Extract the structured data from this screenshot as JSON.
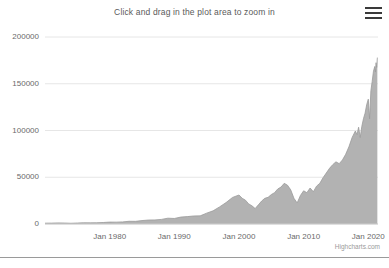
{
  "chart": {
    "title": "Click and drag in the plot area to zoom in",
    "credits": "Highcharts.com",
    "menu_icon": "hamburger-menu-icon",
    "accent_color": "#b2b2b2",
    "line_color": "#9a9a9a",
    "grid_color": "#e6e6e6",
    "text_color": "#6a6a6a"
  },
  "chart_data": {
    "type": "area",
    "title": "Click and drag in the plot area to zoom in",
    "subtitle": "",
    "xlabel": "",
    "ylabel": "",
    "grid": true,
    "legend": false,
    "xlim": [
      1970,
      2021.5
    ],
    "ylim": [
      0,
      200000
    ],
    "ytick_labels": [
      "0",
      "50000",
      "100000",
      "150000",
      "200000"
    ],
    "ytick_values": [
      0,
      50000,
      100000,
      150000,
      200000
    ],
    "xtick_labels": [
      "Jan 1980",
      "Jan 1990",
      "Jan 2000",
      "Jan 2010",
      "Jan 2020"
    ],
    "xtick_values": [
      1980,
      1990,
      2000,
      2010,
      2020
    ],
    "series": [
      {
        "name": "Index value",
        "x": [
          1970.0,
          1971.0,
          1972.0,
          1973.0,
          1974.0,
          1975.0,
          1976.0,
          1977.0,
          1978.0,
          1979.0,
          1980.0,
          1981.0,
          1982.0,
          1983.0,
          1984.0,
          1985.0,
          1986.0,
          1987.0,
          1988.0,
          1989.0,
          1990.0,
          1991.0,
          1992.0,
          1993.0,
          1994.0,
          1995.0,
          1996.0,
          1997.0,
          1998.0,
          1999.0,
          2000.0,
          2000.5,
          2001.0,
          2001.5,
          2002.0,
          2002.5,
          2003.0,
          2003.5,
          2004.0,
          2004.5,
          2005.0,
          2005.5,
          2006.0,
          2006.5,
          2007.0,
          2007.5,
          2008.0,
          2008.5,
          2009.0,
          2009.5,
          2010.0,
          2010.5,
          2011.0,
          2011.5,
          2012.0,
          2012.5,
          2013.0,
          2013.5,
          2014.0,
          2014.5,
          2015.0,
          2015.5,
          2016.0,
          2016.5,
          2017.0,
          2017.5,
          2018.0,
          2018.25,
          2018.5,
          2018.75,
          2019.0,
          2019.25,
          2019.5,
          2019.75,
          2020.0,
          2020.2,
          2020.4,
          2020.6,
          2020.8,
          2021.0,
          2021.1,
          2021.2,
          2021.3,
          2021.4
        ],
        "y": [
          900,
          950,
          1150,
          1050,
          800,
          1050,
          1300,
          1250,
          1350,
          1600,
          2050,
          2000,
          2250,
          2900,
          2850,
          3650,
          4250,
          4350,
          4900,
          6200,
          5900,
          7400,
          7900,
          8600,
          8700,
          11600,
          14100,
          18300,
          22900,
          28400,
          31000,
          27500,
          25500,
          21500,
          19500,
          16500,
          20500,
          24500,
          27500,
          28500,
          31500,
          33500,
          37500,
          39500,
          43500,
          41500,
          36500,
          27500,
          22500,
          30500,
          35500,
          33500,
          38500,
          34500,
          40500,
          43500,
          49500,
          54500,
          59500,
          63500,
          66500,
          64500,
          68500,
          74500,
          82500,
          92500,
          99500,
          95500,
          103500,
          92500,
          104500,
          112500,
          118500,
          127500,
          133500,
          112500,
          142500,
          152500,
          163500,
          168500,
          162500,
          172500,
          167500,
          178000
        ]
      }
    ]
  }
}
